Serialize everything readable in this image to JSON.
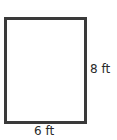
{
  "diagram": {
    "shape": "rectangle",
    "height_label": "8 ft",
    "width_label": "6 ft",
    "stroke_color": "#3a3a3a"
  }
}
